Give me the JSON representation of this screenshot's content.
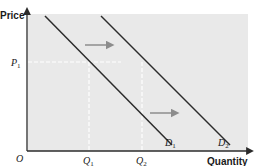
{
  "diagram": {
    "y_axis_label": "Price",
    "x_axis_label": "Quantity",
    "origin_label": "O",
    "price_level": {
      "symbol": "P",
      "subscript": "1"
    },
    "quantities": [
      {
        "symbol": "Q",
        "subscript": "1"
      },
      {
        "symbol": "Q",
        "subscript": "2"
      }
    ],
    "curves": [
      {
        "symbol": "D",
        "subscript": "1"
      },
      {
        "symbol": "D",
        "subscript": "2"
      }
    ],
    "shift_direction": "right",
    "colors": {
      "background": "#e9e9e9",
      "curve": "#2b2b2b",
      "arrow": "#8c8c8c",
      "guide": "#ffffff",
      "axis": "#2b2b2b"
    }
  }
}
